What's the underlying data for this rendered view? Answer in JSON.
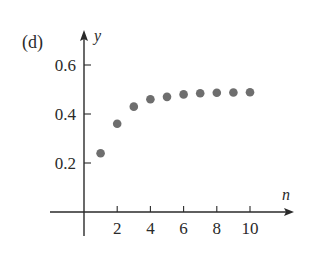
{
  "panel_label": "(d)",
  "colors": {
    "axis": "#2a2a2a",
    "point": "#6e6e6e",
    "background": "#ffffff"
  },
  "chart_data": {
    "type": "scatter",
    "title": "",
    "panel": "(d)",
    "xlabel": "n",
    "ylabel": "y",
    "x": [
      1,
      2,
      3,
      4,
      5,
      6,
      7,
      8,
      9,
      10
    ],
    "series": [
      {
        "name": "a_n",
        "values": [
          0.24,
          0.36,
          0.43,
          0.46,
          0.47,
          0.48,
          0.485,
          0.487,
          0.488,
          0.489
        ]
      }
    ],
    "xticks": [
      2,
      4,
      6,
      8,
      10
    ],
    "xtick_labels": [
      "2",
      "4",
      "6",
      "8",
      "10"
    ],
    "yticks": [
      0.2,
      0.4,
      0.6
    ],
    "ytick_labels": [
      "0.2",
      "0.4",
      "0.6"
    ],
    "xlim": [
      -2,
      12.5
    ],
    "ylim": [
      -0.1,
      0.73
    ],
    "grid": false,
    "legend": null
  }
}
